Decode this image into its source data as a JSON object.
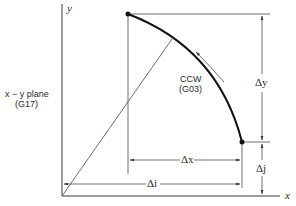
{
  "diagram": {
    "axes": {
      "x_label": "x",
      "y_label": "y"
    },
    "plane_label": {
      "line1": "x − y  plane",
      "line2": "(G17)"
    },
    "arc": {
      "direction_label": "CCW",
      "gcode": "(G03)"
    },
    "dimensions": {
      "dx": "Δx",
      "dy": "Δy",
      "di": "Δi",
      "dj": "Δj"
    },
    "colors": {
      "ink": "#111111",
      "background": "#ffffff"
    }
  }
}
